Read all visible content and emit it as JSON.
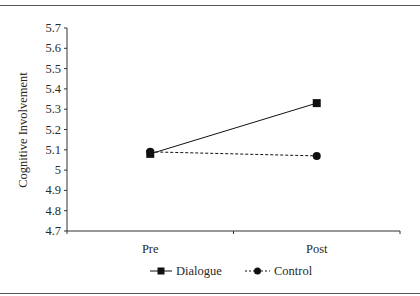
{
  "chart_data": {
    "type": "line",
    "title": "",
    "xlabel": "",
    "ylabel": "Cognitive Involvement",
    "categories": [
      "Pre",
      "Post"
    ],
    "ylim": [
      4.7,
      5.7
    ],
    "yticks": [
      "5.7",
      "5.6",
      "5.5",
      "5.4",
      "5.3",
      "5.2",
      "5.1",
      "5",
      "4.9",
      "4.8",
      "4.7"
    ],
    "grid": false,
    "legend_position": "bottom",
    "series": [
      {
        "name": "Dialogue",
        "values": [
          5.08,
          5.33
        ],
        "marker": "square",
        "line": "solid",
        "color": "#111111"
      },
      {
        "name": "Control",
        "values": [
          5.09,
          5.07
        ],
        "marker": "circle",
        "line": "dashed",
        "color": "#111111"
      }
    ]
  }
}
